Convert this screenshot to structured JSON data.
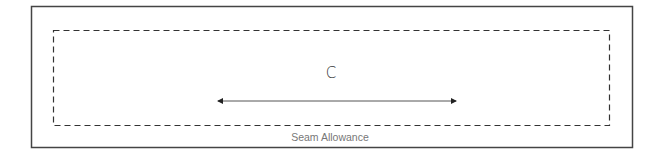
{
  "diagram": {
    "piece": {
      "label": "C",
      "outline_color": "#444444",
      "seam_line_color": "#333333"
    },
    "grainline": {
      "direction": "horizontal",
      "arrow_style": "double-headed",
      "color": "#555555"
    },
    "seam_allowance": {
      "label": "Seam Allowance",
      "label_color": "#777777",
      "line_style": "dashed"
    }
  }
}
